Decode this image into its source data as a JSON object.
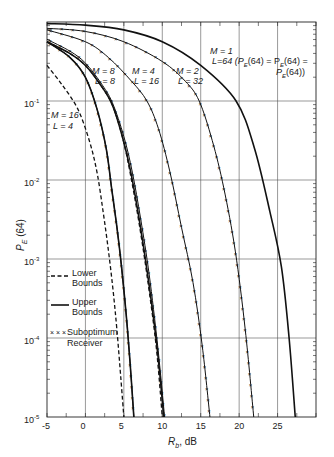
{
  "chart_data": {
    "type": "line",
    "title": "",
    "xlabel": "R_b, dB",
    "ylabel": "P_E (64)",
    "xlim": [
      -5,
      30
    ],
    "ylim": [
      1e-05,
      1
    ],
    "yscale": "log",
    "grid": true,
    "x_ticks": [
      -5,
      0,
      5,
      10,
      15,
      20,
      25
    ],
    "y_ticks": [
      "10^-1",
      "10^-2",
      "10^-3",
      "10^-4",
      "10^-5"
    ],
    "legend": [
      {
        "label": "Lower Bounds",
        "style": "dashed"
      },
      {
        "label": "Upper Bounds",
        "style": "solid"
      },
      {
        "label": "Suboptimum Receiver",
        "style": "x-markers"
      }
    ],
    "annotations": [
      "M = 16, L = 4",
      "M = 8, L = 8",
      "M = 4, L = 16",
      "M = 2, L = 32",
      "M = 1, L = 64 (P_E_l(64) = P_E_s(64) = P_E(64))"
    ],
    "series": [
      {
        "name": "M=1, L=64",
        "style": "solid",
        "x": [
          -5,
          0,
          5,
          10,
          15,
          19.6,
          22,
          24,
          25.5,
          26.5,
          27.3
        ],
        "log10_y": [
          -0.02,
          -0.04,
          -0.1,
          -0.25,
          -0.55,
          -1,
          -1.6,
          -2.4,
          -3.1,
          -4,
          -5
        ]
      },
      {
        "name": "M=2, L=32 suboptimum",
        "style": "x",
        "x": [
          -5,
          0,
          5,
          10,
          13,
          14.8,
          16.5,
          18,
          19.5,
          20.8,
          21.9
        ],
        "log10_y": [
          -0.08,
          -0.12,
          -0.25,
          -0.5,
          -0.75,
          -1,
          -1.5,
          -2.1,
          -2.9,
          -3.9,
          -5
        ]
      },
      {
        "name": "M=4, L=16 suboptimum",
        "style": "x",
        "x": [
          -5,
          0,
          3,
          6,
          8,
          9.5,
          11,
          12.5,
          14,
          15.2,
          16.2
        ],
        "log10_y": [
          -0.1,
          -0.25,
          -0.45,
          -0.75,
          -1,
          -1.35,
          -1.9,
          -2.6,
          -3.3,
          -4.1,
          -5
        ]
      },
      {
        "name": "M=8, L=8 lower",
        "style": "dashed",
        "x": [
          -5,
          -2,
          0,
          2,
          3.5,
          4.8,
          5.8,
          6.9,
          8,
          9.2,
          10
        ],
        "log10_y": [
          -0.25,
          -0.4,
          -0.55,
          -0.8,
          -1.05,
          -1.45,
          -1.9,
          -2.5,
          -3.2,
          -4.1,
          -5
        ]
      },
      {
        "name": "M=8, L=8 upper",
        "style": "solid",
        "x": [
          -5,
          -2,
          0,
          2,
          3.5,
          4.8,
          5.9,
          7,
          8.1,
          9.3,
          10.2
        ],
        "log10_y": [
          -0.25,
          -0.4,
          -0.55,
          -0.8,
          -1.05,
          -1.45,
          -1.9,
          -2.5,
          -3.2,
          -4.1,
          -5
        ]
      },
      {
        "name": "M=8, L=8 suboptimum",
        "style": "x",
        "x": [
          -5,
          -2,
          0,
          2,
          3.5,
          5,
          6.1,
          7.2,
          8.3,
          9.4,
          10.3
        ],
        "log10_y": [
          -0.22,
          -0.37,
          -0.52,
          -0.77,
          -1.02,
          -1.45,
          -1.9,
          -2.5,
          -3.2,
          -4.1,
          -5
        ]
      },
      {
        "name": "M=16, L=4 lower",
        "style": "dashed",
        "x": [
          -5,
          -3,
          -1,
          0.5,
          1.5,
          2.3,
          3,
          3.6,
          4.1,
          4.6,
          5
        ],
        "log10_y": [
          -0.55,
          -0.8,
          -1.1,
          -1.5,
          -1.9,
          -2.4,
          -2.9,
          -3.4,
          -3.9,
          -4.5,
          -5
        ]
      },
      {
        "name": "M=16, L=4 upper",
        "style": "solid",
        "x": [
          -5,
          -2,
          0,
          1.5,
          2.7,
          3.4,
          4.1,
          4.7,
          5.3,
          5.8,
          6.3
        ],
        "log10_y": [
          -0.25,
          -0.45,
          -0.7,
          -1.1,
          -1.6,
          -2.1,
          -2.6,
          -3.1,
          -3.7,
          -4.3,
          -5
        ]
      },
      {
        "name": "M=16, L=4 suboptimum",
        "style": "x",
        "x": [
          -5,
          -2,
          0,
          1.5,
          2.7,
          3.4,
          4.1,
          4.7,
          5.3,
          5.8,
          6.3
        ],
        "log10_y": [
          -0.25,
          -0.45,
          -0.7,
          -1.1,
          -1.6,
          -2.1,
          -2.6,
          -3.1,
          -3.7,
          -4.3,
          -5
        ]
      }
    ]
  },
  "labels": {
    "x_axis_label": "R",
    "x_axis_sub": "b",
    "x_axis_unit": ", dB",
    "y_axis_label": "P",
    "y_axis_sub": "E",
    "y_axis_rest": " (64)",
    "m16": "M = 16",
    "l4": "L = 4",
    "m8": "M = 8",
    "l8": "L = 8",
    "m4": "M = 4",
    "l16": "L = 16",
    "m2": "M = 2",
    "l32": "L = 32",
    "m1": "M = 1",
    "l64": "L=64 (P",
    "m1_eq1": "(64) = P",
    "m1_eq2": "(64) =",
    "m1_eq3": "P",
    "m1_eq4": "(64))",
    "legend_lower_1": "Lower",
    "legend_lower_2": "Bounds",
    "legend_upper_1": "Upper",
    "legend_upper_2": "Bounds",
    "legend_sub_1": "Suboptimum",
    "legend_sub_2": "Receiver"
  }
}
